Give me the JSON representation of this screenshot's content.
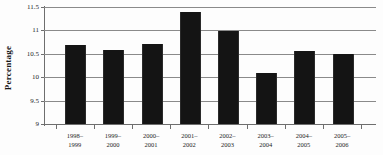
{
  "chart_data": {
    "type": "bar",
    "title": "",
    "xlabel": "",
    "ylabel": "Percentage",
    "categories": [
      "1998–\n1999",
      "1999–\n2000",
      "2000–\n2001",
      "2001–\n2002",
      "2002–\n2003",
      "2003–\n2004",
      "2004–\n2005",
      "2005–\n2006"
    ],
    "category_lines": [
      {
        "line1": "1998–",
        "line2": "1999"
      },
      {
        "line1": "1999–",
        "line2": "2000"
      },
      {
        "line1": "2000–",
        "line2": "2001"
      },
      {
        "line1": "2001–",
        "line2": "2002"
      },
      {
        "line1": "2002–",
        "line2": "2003"
      },
      {
        "line1": "2003–",
        "line2": "2004"
      },
      {
        "line1": "2004–",
        "line2": "2005"
      },
      {
        "line1": "2005–",
        "line2": "2006"
      }
    ],
    "values": [
      10.68,
      10.59,
      10.7,
      11.39,
      10.99,
      10.1,
      10.57,
      10.49
    ],
    "ylim": [
      9,
      11.5
    ],
    "yticks": [
      9,
      9.5,
      10,
      10.5,
      11,
      11.5
    ],
    "ytick_labels": [
      "9",
      "9.5",
      "10",
      "10.5",
      "11",
      "11.5"
    ],
    "grid": true,
    "legend": "none",
    "bar_color": "#141414",
    "gridline_color": "#8a8a8a",
    "axis_color": "#6e6e6e"
  }
}
